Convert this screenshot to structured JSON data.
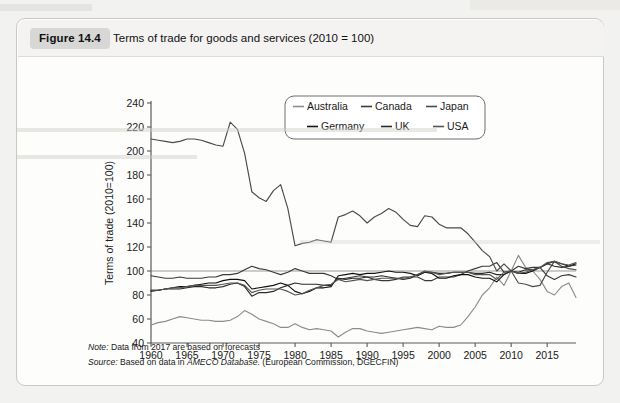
{
  "figure": {
    "badge": "Figure 14.4",
    "caption": "Terms of trade for goods and services (2010  =  100)"
  },
  "notes": {
    "note_label": "Note:",
    "note_text": " Data from 2017 are based on forecasts",
    "source_label": "Source:",
    "source_text_a": " Based on data in ",
    "source_italic": "AMECO Database.",
    "source_text_b": " (European Commission, DGECFIN)"
  },
  "colors": {
    "australia": "#8c8c8c",
    "canada": "#3a3a3a",
    "japan": "#4a4a4a",
    "germany": "#111111",
    "uk": "#2b2b2b",
    "usa": "#555555",
    "axis": "#5a5a5a",
    "reference_line": "#9a9a9a",
    "card_background": "#fdfdfc",
    "badge_background": "#d7d7d5"
  },
  "chart_data": {
    "type": "line",
    "title": "Terms of trade for goods and services (2010 = 100)",
    "xlabel": "",
    "ylabel": "Terms of trade (2010=100)",
    "xlim": [
      1960,
      2019
    ],
    "ylim": [
      40,
      240
    ],
    "ytick_step": 20,
    "xtick_step": 5,
    "yticks": [
      40,
      60,
      80,
      100,
      120,
      140,
      160,
      180,
      200,
      220,
      240
    ],
    "xticks": [
      1960,
      1965,
      1970,
      1975,
      1980,
      1985,
      1990,
      1995,
      2000,
      2005,
      2010,
      2015
    ],
    "grid": false,
    "reference_line_y": 100,
    "legend_position": "top-center",
    "legend": [
      "Australia",
      "Canada",
      "Japan",
      "Germany",
      "UK",
      "USA"
    ],
    "x": [
      1960,
      1961,
      1962,
      1963,
      1964,
      1965,
      1966,
      1967,
      1968,
      1969,
      1970,
      1971,
      1972,
      1973,
      1974,
      1975,
      1976,
      1977,
      1978,
      1979,
      1980,
      1981,
      1982,
      1983,
      1984,
      1985,
      1986,
      1987,
      1988,
      1989,
      1990,
      1991,
      1992,
      1993,
      1994,
      1995,
      1996,
      1997,
      1998,
      1999,
      2000,
      2001,
      2002,
      2003,
      2004,
      2005,
      2006,
      2007,
      2008,
      2009,
      2010,
      2011,
      2012,
      2013,
      2014,
      2015,
      2016,
      2017,
      2018,
      2019
    ],
    "series": [
      {
        "name": "Australia",
        "color": "#8c8c8c",
        "values": [
          55,
          57,
          58,
          60,
          62,
          61,
          60,
          59,
          59,
          58,
          58,
          59,
          62,
          67,
          64,
          60,
          58,
          56,
          53,
          53,
          56,
          53,
          51,
          52,
          51,
          50,
          45,
          49,
          52,
          52,
          50,
          49,
          48,
          49,
          50,
          51,
          52,
          53,
          52,
          51,
          54,
          53,
          53,
          55,
          62,
          70,
          80,
          86,
          95,
          88,
          100,
          113,
          103,
          100,
          93,
          83,
          80,
          87,
          90,
          78
        ]
      },
      {
        "name": "Canada",
        "color": "#3a3a3a",
        "values": [
          96,
          95,
          94,
          94,
          95,
          94,
          94,
          94,
          95,
          95,
          97,
          97,
          98,
          101,
          104,
          102,
          101,
          99,
          97,
          99,
          102,
          100,
          98,
          98,
          98,
          96,
          93,
          94,
          95,
          96,
          95,
          93,
          92,
          92,
          93,
          95,
          95,
          95,
          92,
          92,
          95,
          95,
          95,
          97,
          100,
          102,
          104,
          104,
          107,
          99,
          100,
          104,
          102,
          103,
          103,
          96,
          93,
          96,
          97,
          95
        ]
      },
      {
        "name": "Japan",
        "color": "#4a4a4a",
        "values": [
          210,
          209,
          208,
          207,
          208,
          210,
          210,
          209,
          207,
          205,
          204,
          224,
          218,
          198,
          166,
          161,
          158,
          167,
          172,
          152,
          121,
          123,
          124,
          126,
          125,
          124,
          145,
          147,
          150,
          146,
          140,
          145,
          148,
          152,
          149,
          143,
          138,
          137,
          146,
          145,
          139,
          136,
          136,
          136,
          131,
          124,
          117,
          112,
          100,
          106,
          100,
          90,
          89,
          87,
          88,
          99,
          108,
          104,
          102,
          101
        ]
      },
      {
        "name": "Germany",
        "color": "#111111",
        "values": [
          84,
          84,
          85,
          86,
          87,
          87,
          88,
          89,
          90,
          90,
          92,
          93,
          93,
          92,
          85,
          86,
          87,
          88,
          90,
          88,
          83,
          81,
          83,
          86,
          86,
          87,
          96,
          97,
          98,
          97,
          98,
          98,
          99,
          100,
          99,
          99,
          98,
          96,
          99,
          98,
          94,
          94,
          96,
          97,
          97,
          95,
          94,
          94,
          91,
          97,
          100,
          98,
          98,
          100,
          103,
          106,
          108,
          106,
          104,
          106
        ]
      },
      {
        "name": "UK",
        "color": "#2b2b2b",
        "values": [
          83,
          84,
          85,
          85,
          85,
          86,
          87,
          87,
          86,
          86,
          87,
          89,
          90,
          87,
          79,
          82,
          82,
          83,
          86,
          88,
          90,
          89,
          89,
          89,
          88,
          88,
          94,
          93,
          94,
          94,
          95,
          95,
          96,
          95,
          94,
          93,
          94,
          97,
          99,
          99,
          98,
          98,
          99,
          99,
          99,
          98,
          98,
          99,
          97,
          97,
          100,
          99,
          101,
          101,
          103,
          106,
          104,
          103,
          104,
          105
        ]
      },
      {
        "name": "USA",
        "color": "#555555",
        "values": [
          84,
          84,
          85,
          86,
          86,
          87,
          88,
          88,
          88,
          88,
          89,
          90,
          90,
          88,
          82,
          84,
          85,
          85,
          85,
          83,
          80,
          81,
          84,
          86,
          88,
          89,
          93,
          91,
          92,
          93,
          92,
          93,
          94,
          94,
          94,
          94,
          95,
          97,
          100,
          99,
          97,
          98,
          99,
          99,
          99,
          97,
          97,
          97,
          93,
          99,
          100,
          98,
          99,
          101,
          103,
          107,
          108,
          106,
          105,
          107
        ]
      }
    ]
  },
  "axis_labels": {
    "y_title": "Terms of trade (2010=100)"
  }
}
